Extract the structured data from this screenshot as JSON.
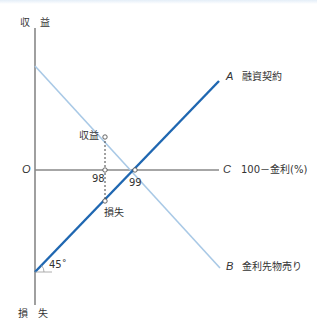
{
  "diagram": {
    "axes": {
      "y_top_label": "収　益",
      "y_bottom_label": "損　失",
      "origin_label": "O",
      "x_axis_letter": "C",
      "x_axis_label": "100－金利(%)"
    },
    "lines": [
      {
        "id": "A",
        "letter": "A",
        "label": "融資契約",
        "color": "#1f67b1",
        "direction": "rising"
      },
      {
        "id": "B",
        "letter": "B",
        "label": "金利先物売り",
        "color": "#a9c9e6",
        "direction": "falling"
      }
    ],
    "points": {
      "profit_label": "収益",
      "loss_label": "損失",
      "x_98": "98",
      "x_99": "99"
    },
    "angle_label": "45˚",
    "colors": {
      "axis": "#888888",
      "line_a": "#1f67b1",
      "line_b": "#a9c9e6"
    }
  }
}
